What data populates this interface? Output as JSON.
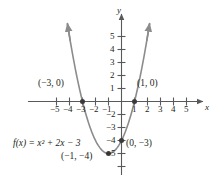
{
  "chart_data": {
    "type": "line",
    "title": "",
    "function_label": "f(x) = x² + 2x − 3",
    "equation_plain": "f(x) = x^2 + 2x - 3",
    "coefficients": {
      "a": 1,
      "b": 2,
      "c": -3
    },
    "xlabel": "x",
    "ylabel": "y",
    "xlim": [
      -6,
      6
    ],
    "ylim": [
      -5.8,
      6
    ],
    "grid": false,
    "curve_color": "#8c8c8c",
    "axis_color": "#58595b",
    "text_color": "#231f20",
    "x_ticks": [
      -5,
      -4,
      -3,
      -2,
      -1,
      1,
      2,
      3,
      4,
      5
    ],
    "x_tick_labels": [
      "−5",
      "−4",
      "−3",
      "−2",
      "−1",
      "1",
      "2",
      "3",
      "4",
      "5"
    ],
    "y_ticks": [
      5,
      4,
      3,
      2,
      1,
      -2,
      -3,
      -4,
      -5
    ],
    "y_tick_labels": [
      "5",
      "4",
      "3",
      "2",
      "1",
      "−2",
      "−3",
      "−4",
      "−5"
    ],
    "points": [
      {
        "name": "x-intercept-left",
        "label": "(−3, 0)",
        "x": -3,
        "y": 0,
        "marked": true
      },
      {
        "name": "x-intercept-right",
        "label": "(1, 0)",
        "x": 1,
        "y": 0,
        "marked": true
      },
      {
        "name": "y-intercept",
        "label": "(0, −3)",
        "x": 0,
        "y": -3,
        "marked": true
      },
      {
        "name": "vertex",
        "label": "(−1, −4)",
        "x": -1,
        "y": -4,
        "marked": true
      }
    ],
    "curve_points": [
      {
        "x": -4.15,
        "y": 5.92
      },
      {
        "x": -4.0,
        "y": 5.0
      },
      {
        "x": -3.5,
        "y": 2.25
      },
      {
        "x": -3.0,
        "y": 0.0
      },
      {
        "x": -2.5,
        "y": -1.75
      },
      {
        "x": -2.0,
        "y": -3.0
      },
      {
        "x": -1.5,
        "y": -3.75
      },
      {
        "x": -1.0,
        "y": -4.0
      },
      {
        "x": -0.5,
        "y": -3.75
      },
      {
        "x": 0.0,
        "y": -3.0
      },
      {
        "x": 0.5,
        "y": -1.75
      },
      {
        "x": 1.0,
        "y": 0.0
      },
      {
        "x": 1.5,
        "y": 2.25
      },
      {
        "x": 2.0,
        "y": 5.0
      },
      {
        "x": 2.15,
        "y": 5.92
      }
    ],
    "arrows": [
      "x-axis-right",
      "y-axis-up",
      "curve-left-up",
      "curve-right-up"
    ]
  },
  "labels": {
    "y_axis_name": "y",
    "x_axis_name": "x"
  }
}
